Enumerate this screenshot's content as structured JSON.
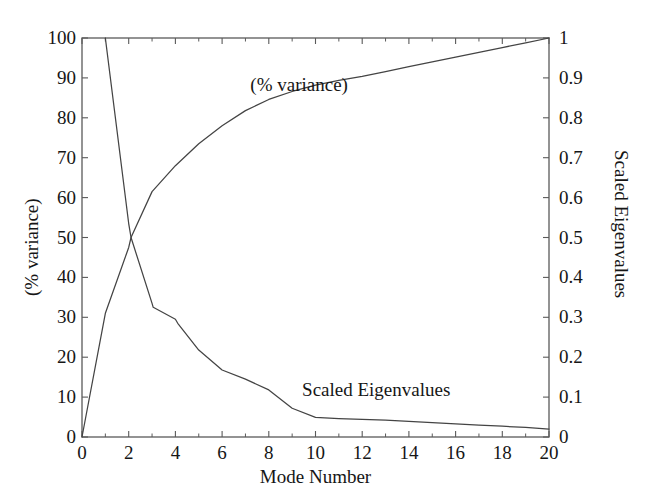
{
  "chart_data": {
    "type": "line",
    "title": "",
    "xlabel": "Mode Number",
    "ylabel": "(% variance)",
    "y2label": "Scaled Eigenvalues",
    "xlim": [
      0,
      20
    ],
    "ylim": [
      0,
      100
    ],
    "y2lim": [
      0,
      1
    ],
    "grid": false,
    "legend_position": "in-plot annotations",
    "xticks": [
      "0",
      "2",
      "4",
      "6",
      "8",
      "10",
      "12",
      "14",
      "16",
      "18",
      "20"
    ],
    "xtick_values": [
      0,
      2,
      4,
      6,
      8,
      10,
      12,
      14,
      16,
      18,
      20
    ],
    "xminor_values": [
      1,
      3,
      5,
      7,
      9,
      11,
      13,
      15,
      17,
      19
    ],
    "yticks": [
      "0",
      "10",
      "20",
      "30",
      "40",
      "50",
      "60",
      "70",
      "80",
      "90",
      "100"
    ],
    "ytick_values": [
      0,
      10,
      20,
      30,
      40,
      50,
      60,
      70,
      80,
      90,
      100
    ],
    "y2ticks": [
      "0",
      "0.1",
      "0.2",
      "0.3",
      "0.4",
      "0.5",
      "0.6",
      "0.7",
      "0.8",
      "0.9",
      "1"
    ],
    "y2tick_values": [
      0,
      0.1,
      0.2,
      0.3,
      0.4,
      0.5,
      0.6,
      0.7,
      0.8,
      0.9,
      1
    ],
    "annotations": [
      {
        "text": "(% variance)",
        "x": 9.3,
        "y": 88.0
      },
      {
        "text": "Scaled Eigenvalues",
        "x": 12.6,
        "y": 11.5
      }
    ],
    "series": [
      {
        "name": "(% variance)",
        "axis": "left",
        "color": "#444444",
        "x": [
          0,
          1,
          2,
          2.1,
          3,
          4,
          5,
          6,
          7,
          8,
          9,
          10,
          11,
          12,
          13,
          14,
          15,
          16,
          17,
          18,
          19,
          20
        ],
        "values": [
          0,
          31.0,
          47.5,
          50.0,
          61.5,
          68.0,
          73.5,
          78.0,
          81.8,
          84.6,
          86.6,
          88.2,
          89.4,
          90.4,
          91.6,
          92.8,
          94.0,
          95.2,
          96.4,
          97.6,
          98.8,
          100.0
        ]
      },
      {
        "name": "Scaled Eigenvalues",
        "axis": "right",
        "color": "#444444",
        "x": [
          1,
          2,
          2.1,
          3,
          3.05,
          4,
          4.1,
          5,
          6,
          7,
          8,
          9,
          10,
          11,
          12,
          13,
          14,
          15,
          16,
          17,
          18,
          19,
          20
        ],
        "values": [
          1.0,
          0.535,
          0.5,
          0.335,
          0.325,
          0.295,
          0.285,
          0.218,
          0.168,
          0.145,
          0.118,
          0.072,
          0.049,
          0.046,
          0.044,
          0.042,
          0.039,
          0.036,
          0.033,
          0.03,
          0.027,
          0.024,
          0.02
        ]
      }
    ]
  },
  "plot_frame": {
    "left": 82,
    "right": 549,
    "top": 38,
    "bottom": 437,
    "axis_color": "#5a5a5a"
  }
}
